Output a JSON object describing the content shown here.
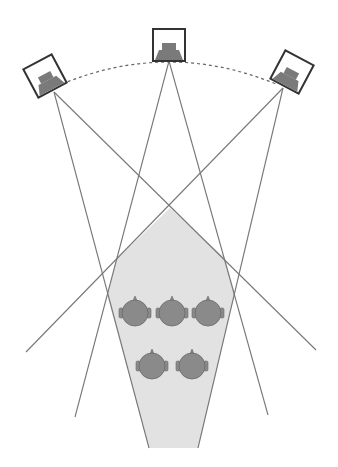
{
  "diagram": {
    "colors": {
      "background": "#ffffff",
      "line": "#777777",
      "speaker_box": "#333333",
      "speaker_driver": "#7a7a7a",
      "arc": "#666666",
      "sweet_spot_fill": "#e2e2e2",
      "sweet_spot_stroke": "#7a7a7a",
      "head_fill": "#8a8a8a",
      "head_stroke": "#6a6a6a"
    },
    "speakers": [
      {
        "name": "left-speaker",
        "cx": 45,
        "cy": 76,
        "rotation": -28
      },
      {
        "name": "center-speaker",
        "cx": 169,
        "cy": 45,
        "rotation": 0
      },
      {
        "name": "right-speaker",
        "cx": 292,
        "cy": 72,
        "rotation": 28
      }
    ],
    "arc": {
      "x1": 62,
      "y1": 84,
      "cx": 169,
      "cy": 40,
      "x2": 276,
      "y2": 84
    },
    "dispersion_lines": [
      {
        "from": [
          54,
          92
        ],
        "to": [
          149,
          448
        ]
      },
      {
        "from": [
          54,
          92
        ],
        "to": [
          316,
          350
        ]
      },
      {
        "from": [
          169,
          61
        ],
        "to": [
          75,
          417
        ]
      },
      {
        "from": [
          169,
          61
        ],
        "to": [
          268,
          415
        ]
      },
      {
        "from": [
          283,
          88
        ],
        "to": [
          198,
          448
        ]
      },
      {
        "from": [
          283,
          88
        ],
        "to": [
          26,
          352
        ]
      }
    ],
    "sweet_spot_polygon": [
      [
        170,
        208
      ],
      [
        225,
        258
      ],
      [
        235,
        293
      ],
      [
        198,
        448
      ],
      [
        149,
        448
      ],
      [
        107,
        295
      ],
      [
        116,
        260
      ]
    ],
    "listeners": [
      {
        "cx": 135,
        "cy": 313
      },
      {
        "cx": 172,
        "cy": 313
      },
      {
        "cx": 208,
        "cy": 313
      },
      {
        "cx": 152,
        "cy": 366
      },
      {
        "cx": 192,
        "cy": 366
      }
    ]
  }
}
